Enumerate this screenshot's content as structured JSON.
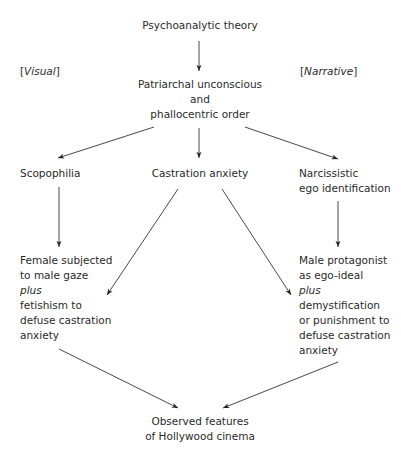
{
  "diagram": {
    "nodes": {
      "root": {
        "text": "Psychoanalytic theory"
      },
      "visual_label": {
        "open": "[",
        "text": "Visual",
        "close": "]"
      },
      "narrative_label": {
        "open": "[",
        "text": "Narrative",
        "close": "]"
      },
      "patriarchal": {
        "line1": "Patriarchal unconscious",
        "line2": "and",
        "line3": "phallocentric order"
      },
      "scopophilia": {
        "text": "Scopophilia"
      },
      "castration": {
        "text": "Castration anxiety"
      },
      "narcissistic": {
        "line1": "Narcissistic",
        "line2": "ego identification"
      },
      "female": {
        "line1": "Female subjected",
        "line2": "to male gaze",
        "line3": "plus",
        "line4": "fetishism to",
        "line5": "defuse castration",
        "line6": "anxiety"
      },
      "male": {
        "line1": "Male protagonist",
        "line2": "as ego-ideal",
        "line3": "plus",
        "line4": "demystification",
        "line5": "or punishment to",
        "line6": "defuse castration",
        "line7": "anxiety"
      },
      "observed": {
        "line1": "Observed features",
        "line2": "of Hollywood cinema"
      }
    },
    "edges": [
      {
        "from": "Psychoanalytic theory",
        "to": "Patriarchal unconscious and phallocentric order"
      },
      {
        "from": "Patriarchal unconscious and phallocentric order",
        "to": "Scopophilia"
      },
      {
        "from": "Patriarchal unconscious and phallocentric order",
        "to": "Castration anxiety"
      },
      {
        "from": "Patriarchal unconscious and phallocentric order",
        "to": "Narcissistic ego identification"
      },
      {
        "from": "Scopophilia",
        "to": "Female subjected to male gaze plus fetishism to defuse castration anxiety"
      },
      {
        "from": "Castration anxiety",
        "to": "Female subjected to male gaze plus fetishism to defuse castration anxiety"
      },
      {
        "from": "Castration anxiety",
        "to": "Male protagonist as ego-ideal plus demystification or punishment to defuse castration anxiety"
      },
      {
        "from": "Narcissistic ego identification",
        "to": "Male protagonist as ego-ideal plus demystification or punishment to defuse castration anxiety"
      },
      {
        "from": "Female subjected to male gaze plus fetishism to defuse castration anxiety",
        "to": "Observed features of Hollywood cinema"
      },
      {
        "from": "Male protagonist as ego-ideal plus demystification or punishment to defuse castration anxiety",
        "to": "Observed features of Hollywood cinema"
      }
    ],
    "colors": {
      "text": "#2a2a2a",
      "line": "#333333",
      "background": "#ffffff"
    }
  }
}
